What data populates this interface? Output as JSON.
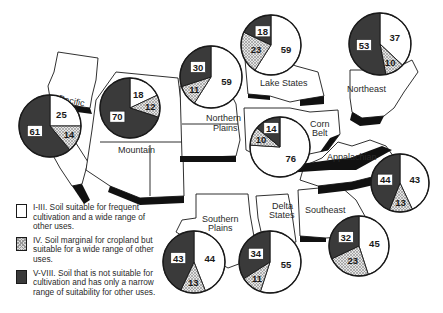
{
  "legend": {
    "items": [
      {
        "key": "I-III",
        "text": "I-III. Soil suitable for frequent cultivation and a wide range of other uses.",
        "fill": "white"
      },
      {
        "key": "IV",
        "text": "IV. Soil marginal for cropland but suitable for a wide range of other uses.",
        "fill": "hatched"
      },
      {
        "key": "V-VIII",
        "text": "V-VIII. Soil that is not suitable for cultivation and has only a narrow range of suitability for other uses.",
        "fill": "dark"
      }
    ]
  },
  "colors": {
    "class_I_III": "#ffffff",
    "class_IV": "#d8d8d8",
    "class_V_VIII": "#3a3a3a",
    "outline": "#1a1a1a"
  },
  "chart_data": {
    "type": "pie",
    "categories": [
      "I-III",
      "IV",
      "V-VIII"
    ],
    "series": [
      {
        "name": "Pacific",
        "values": [
          25,
          14,
          61
        ]
      },
      {
        "name": "Mountain",
        "values": [
          18,
          12,
          70
        ]
      },
      {
        "name": "Northern Plains",
        "values": [
          59,
          11,
          30
        ]
      },
      {
        "name": "Lake States",
        "values": [
          59,
          23,
          18
        ]
      },
      {
        "name": "Corn Belt",
        "values": [
          76,
          10,
          14
        ]
      },
      {
        "name": "Northeast",
        "values": [
          37,
          10,
          53
        ]
      },
      {
        "name": "Appalachian",
        "values": [
          43,
          13,
          44
        ]
      },
      {
        "name": "Southeast",
        "values": [
          45,
          23,
          32
        ]
      },
      {
        "name": "Delta States",
        "values": [
          55,
          11,
          34
        ]
      },
      {
        "name": "Southern Plains",
        "values": [
          44,
          13,
          43
        ]
      }
    ]
  },
  "regions": {
    "pacific": {
      "label": "Pacific"
    },
    "mountain": {
      "label": "Mountain"
    },
    "northern_plains": {
      "label_1": "Northern",
      "label_2": "Plains"
    },
    "lake_states": {
      "label": "Lake States"
    },
    "corn_belt": {
      "label_1": "Corn",
      "label_2": "Belt"
    },
    "northeast": {
      "label": "Northeast"
    },
    "appalachian": {
      "label": "Appalachian"
    },
    "southeast": {
      "label": "Southeast"
    },
    "delta_states": {
      "label_1": "Delta",
      "label_2": "States"
    },
    "southern_plains": {
      "label_1": "Southern",
      "label_2": "Plains"
    }
  }
}
